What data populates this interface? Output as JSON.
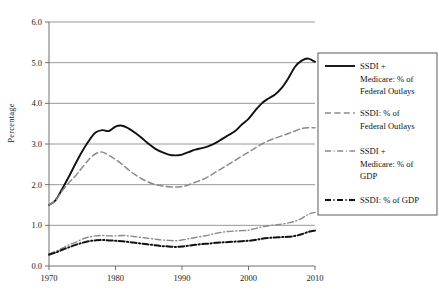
{
  "figure": {
    "background": "#ffffff",
    "ylabel": "Percentage"
  },
  "axes": {
    "y_ticks": [
      "0.0",
      "1.0",
      "2.0",
      "3.0",
      "4.0",
      "5.0",
      "6.0"
    ],
    "x_ticks": [
      "1970",
      "1980",
      "1990",
      "2000",
      "2010"
    ]
  },
  "legend": {
    "items": [
      {
        "label_line1": "SSDI +",
        "label_line2": "Medicare: % of",
        "label_line3": "Federal Outlays",
        "style": "solid-black",
        "color": "#111111"
      },
      {
        "label_line1": "SSDI: % of",
        "label_line2": "Federal Outlays",
        "label_line3": "",
        "style": "dashed-gray",
        "color": "#8a8a8a"
      },
      {
        "label_line1": "SSDI +",
        "label_line2": "Medicare: % of",
        "label_line3": "GDP",
        "style": "dashdot-gray",
        "color": "#8a8a8a"
      },
      {
        "label_line1": "SSDI: % of GDP",
        "label_line2": "",
        "label_line3": "",
        "style": "dashdot-black",
        "color": "#111111"
      }
    ]
  },
  "chart_data": {
    "type": "line",
    "title": "",
    "xlabel": "",
    "ylabel": "Percentage",
    "xlim": [
      1970,
      2010
    ],
    "ylim": [
      0.0,
      6.0
    ],
    "grid": "horizontal",
    "legend_position": "right",
    "x": [
      1970,
      1971,
      1972,
      1973,
      1974,
      1975,
      1976,
      1977,
      1978,
      1979,
      1980,
      1981,
      1982,
      1983,
      1984,
      1985,
      1986,
      1987,
      1988,
      1989,
      1990,
      1991,
      1992,
      1993,
      1994,
      1995,
      1996,
      1997,
      1998,
      1999,
      2000,
      2001,
      2002,
      2003,
      2004,
      2005,
      2006,
      2007,
      2008,
      2009,
      2010
    ],
    "series": [
      {
        "name": "SSDI + Medicare: % of Federal Outlays",
        "style": "solid-black",
        "color": "#111111",
        "values": [
          1.5,
          1.62,
          1.9,
          2.2,
          2.52,
          2.82,
          3.08,
          3.28,
          3.34,
          3.32,
          3.43,
          3.45,
          3.38,
          3.27,
          3.14,
          3.0,
          2.88,
          2.8,
          2.74,
          2.72,
          2.74,
          2.8,
          2.86,
          2.9,
          2.95,
          3.02,
          3.12,
          3.22,
          3.32,
          3.48,
          3.62,
          3.82,
          4.0,
          4.12,
          4.22,
          4.38,
          4.62,
          4.9,
          5.05,
          5.1,
          5.02
        ]
      },
      {
        "name": "SSDI: % of Federal Outlays",
        "style": "dashed-gray",
        "color": "#8a8a8a",
        "values": [
          1.5,
          1.62,
          1.85,
          2.05,
          2.22,
          2.42,
          2.62,
          2.76,
          2.8,
          2.72,
          2.62,
          2.5,
          2.36,
          2.24,
          2.14,
          2.06,
          2.0,
          1.97,
          1.95,
          1.94,
          1.95,
          2.0,
          2.06,
          2.12,
          2.2,
          2.3,
          2.4,
          2.5,
          2.6,
          2.7,
          2.8,
          2.9,
          3.0,
          3.08,
          3.14,
          3.2,
          3.26,
          3.32,
          3.38,
          3.4,
          3.4
        ]
      },
      {
        "name": "SSDI + Medicare: % of GDP",
        "style": "dashdot-gray",
        "color": "#8a8a8a",
        "values": [
          0.3,
          0.36,
          0.44,
          0.52,
          0.58,
          0.66,
          0.71,
          0.74,
          0.75,
          0.74,
          0.74,
          0.75,
          0.74,
          0.72,
          0.7,
          0.68,
          0.66,
          0.64,
          0.63,
          0.62,
          0.64,
          0.67,
          0.7,
          0.73,
          0.76,
          0.8,
          0.83,
          0.85,
          0.86,
          0.87,
          0.88,
          0.92,
          0.96,
          0.99,
          1.01,
          1.03,
          1.06,
          1.1,
          1.17,
          1.27,
          1.32
        ]
      },
      {
        "name": "SSDI: % of GDP",
        "style": "dashdot-black",
        "color": "#111111",
        "values": [
          0.28,
          0.33,
          0.4,
          0.46,
          0.52,
          0.57,
          0.61,
          0.63,
          0.64,
          0.63,
          0.62,
          0.61,
          0.59,
          0.57,
          0.55,
          0.53,
          0.51,
          0.49,
          0.48,
          0.47,
          0.48,
          0.5,
          0.52,
          0.54,
          0.55,
          0.57,
          0.58,
          0.59,
          0.6,
          0.61,
          0.62,
          0.64,
          0.67,
          0.69,
          0.7,
          0.71,
          0.72,
          0.74,
          0.78,
          0.84,
          0.87
        ]
      }
    ]
  }
}
